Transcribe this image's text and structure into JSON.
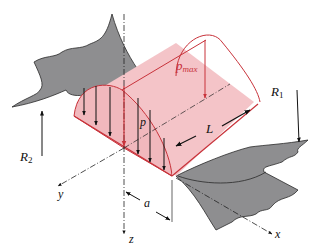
{
  "diagram": {
    "labels": {
      "pmax": "p",
      "pmax_sub": "max",
      "p": "p",
      "L": "L",
      "R1": "R",
      "R1_sub": "1",
      "R2": "R",
      "R2_sub": "2",
      "a": "a",
      "x": "x",
      "y": "y",
      "z": "z"
    },
    "colors": {
      "surface": "#8e8e90",
      "surface_stroke": "#333333",
      "contact_fill": "#f4c4c8",
      "contact_stroke": "#c8323a",
      "arrow": "#111111",
      "pmax_arrow": "#c8323a",
      "label": "#111111",
      "pmax_label": "#c8323a"
    }
  }
}
